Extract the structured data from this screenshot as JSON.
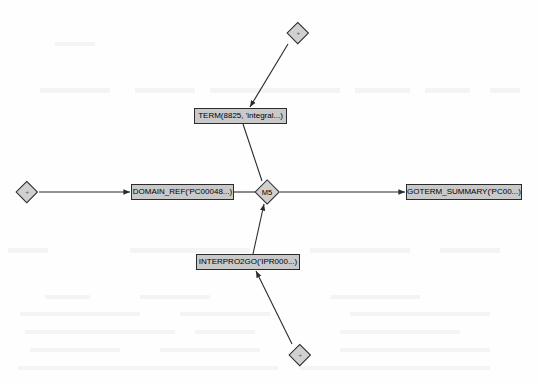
{
  "diagram": {
    "type": "graph",
    "title": "",
    "canvas": {
      "width": 538,
      "height": 384,
      "background": "#fefefe"
    },
    "style": {
      "node_fill": "#c9c9c9",
      "node_border": "#2b2b2b",
      "diamond_fill": "#d0d0d0",
      "edge_color": "#2b2b2b",
      "text_color": "#000000"
    },
    "nodes": [
      {
        "id": "term",
        "shape": "rectangle",
        "label": "TERM(8825, 'integral...)",
        "x": 194,
        "y": 108,
        "width": 93,
        "height": 16
      },
      {
        "id": "domain_ref",
        "shape": "rectangle",
        "label": "DOMAIN_REF('PC00048...)",
        "x": 131,
        "y": 184,
        "width": 103,
        "height": 16
      },
      {
        "id": "goterm_summary",
        "shape": "rectangle",
        "label": "GOTERM_SUMMARY('PC00...)",
        "x": 406,
        "y": 184,
        "width": 116,
        "height": 16
      },
      {
        "id": "interpro2go",
        "shape": "rectangle",
        "label": "INTERPRO2GO('IPR000...)",
        "x": 196,
        "y": 254,
        "width": 104,
        "height": 16
      },
      {
        "id": "m5",
        "shape": "diamond",
        "label": "M5",
        "cx": 267,
        "cy": 192,
        "size": 26
      },
      {
        "id": "diamond_top",
        "shape": "diamond",
        "label": "",
        "marker": "+",
        "cx": 298,
        "cy": 33,
        "size": 22
      },
      {
        "id": "diamond_left",
        "shape": "diamond",
        "label": "",
        "marker": "+",
        "cx": 27,
        "cy": 192,
        "size": 22
      },
      {
        "id": "diamond_bottom",
        "shape": "diamond",
        "label": "",
        "marker": "+",
        "cx": 300,
        "cy": 355,
        "size": 22
      }
    ],
    "edges": [
      {
        "id": "e1",
        "from": "diamond_top",
        "to": "term",
        "arrow": "target",
        "x1": 288,
        "y1": 44,
        "x2": 250,
        "y2": 107
      },
      {
        "id": "e2",
        "from": "term",
        "to": "m5",
        "arrow": "none",
        "x1": 243,
        "y1": 124,
        "x2": 262,
        "y2": 181
      },
      {
        "id": "e3",
        "from": "diamond_left",
        "to": "domain_ref",
        "arrow": "target",
        "x1": 39,
        "y1": 192,
        "x2": 130,
        "y2": 192
      },
      {
        "id": "e4",
        "from": "domain_ref",
        "to": "m5",
        "arrow": "none",
        "x1": 234,
        "y1": 192,
        "x2": 255,
        "y2": 192
      },
      {
        "id": "e5",
        "from": "m5",
        "to": "goterm_summary",
        "arrow": "target",
        "x1": 280,
        "y1": 192,
        "x2": 405,
        "y2": 192
      },
      {
        "id": "e6",
        "from": "interpro2go",
        "to": "m5",
        "arrow": "target",
        "x1": 253,
        "y1": 254,
        "x2": 264,
        "y2": 204
      },
      {
        "id": "e7",
        "from": "diamond_bottom",
        "to": "interpro2go",
        "arrow": "target",
        "x1": 292,
        "y1": 344,
        "x2": 256,
        "y2": 271
      }
    ]
  }
}
